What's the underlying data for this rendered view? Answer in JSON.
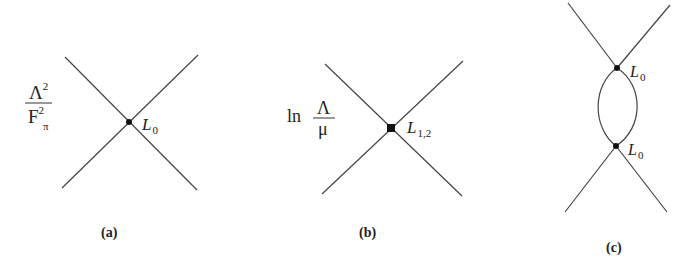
{
  "figure": {
    "panels": [
      {
        "id": "a",
        "caption": "(a)",
        "prefactor": {
          "numerator": "Λ",
          "numerator_sup": "2",
          "denominator": "F",
          "denominator_sup": "2",
          "denominator_sub": "π"
        },
        "vertex": {
          "shape": "dot",
          "label": "L",
          "label_sub": "0"
        }
      },
      {
        "id": "b",
        "caption": "(b)",
        "prefactor": {
          "log": "ln",
          "numerator": "Λ",
          "denominator": "μ"
        },
        "vertex": {
          "shape": "square",
          "label": "L",
          "label_sub": "1,2"
        }
      },
      {
        "id": "c",
        "caption": "(c)",
        "vertices": [
          {
            "shape": "dot",
            "label": "L",
            "label_sub": "0"
          },
          {
            "shape": "dot",
            "label": "L",
            "label_sub": "0"
          }
        ],
        "loop": "one-loop bubble"
      }
    ],
    "colors": {
      "line": "#444444",
      "vertex": "#111111",
      "background": "#ffffff"
    }
  }
}
